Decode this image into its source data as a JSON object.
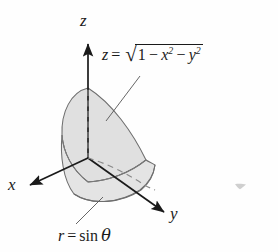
{
  "figure": {
    "name": "solid-bounded-by-hemisphere-and-cylinder",
    "background_color": "#fefefe",
    "fill_color": "#dedede",
    "outline_color": "#6e6e6e",
    "axis_color": "#1a1a1a",
    "dash_color": "#8a8a8a",
    "leader_color": "#555555"
  },
  "axes": {
    "origin": {
      "x": 88,
      "y": 158
    },
    "z": {
      "label": "z",
      "direction": "up",
      "tip": {
        "x": 88,
        "y": 42
      }
    },
    "x": {
      "label": "x",
      "direction": "down-left",
      "tip": {
        "x": 28,
        "y": 186
      }
    },
    "y": {
      "label": "y",
      "direction": "down-right",
      "tip": {
        "x": 166,
        "y": 214
      }
    }
  },
  "labels": {
    "surface": {
      "lhs": "z",
      "equals": "=",
      "radicand_first": "1",
      "minus_one": "−",
      "term_x": "x",
      "exp_x": "2",
      "minus_two": "−",
      "term_y": "y",
      "exp_y": "2",
      "plain": "z = √(1 − x² − y²)"
    },
    "base_curve": {
      "lhs": "r",
      "equals": "=",
      "rhs_fn": "sin",
      "rhs_var": "θ",
      "plain": "r = sin θ"
    }
  },
  "annotations": {
    "leader_surface": {
      "from": {
        "x": 140,
        "y": 76
      },
      "to": {
        "x": 106,
        "y": 121
      }
    },
    "leader_base": {
      "from": {
        "x": 76,
        "y": 224
      },
      "to": {
        "x": 103,
        "y": 197
      }
    },
    "speck": {
      "x": 234,
      "y": 183,
      "description": "scan-artifact-speck"
    }
  }
}
